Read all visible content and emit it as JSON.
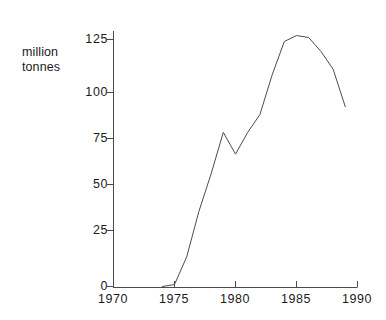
{
  "chart_data": {
    "type": "line",
    "title": "",
    "subtitle": "",
    "xlabel": "",
    "ylabel": "million\ntonnes",
    "ylabel_lines": [
      "million",
      "tonnes"
    ],
    "units": "million tonnes",
    "grid": false,
    "legend": null,
    "legend_position": "none",
    "xlim": [
      1970,
      1990
    ],
    "ylim": [
      0,
      137
    ],
    "xticks": [
      1970,
      1975,
      1980,
      1985,
      1990
    ],
    "xtick_labels": [
      "1970",
      "1975",
      "1980",
      "1985",
      "1990"
    ],
    "yticks": [
      0,
      25,
      50,
      75,
      100,
      125
    ],
    "ytick_labels": [
      "0",
      "25",
      "50",
      "75",
      "100",
      "125"
    ],
    "x": [
      1974,
      1975,
      1976,
      1977,
      1978,
      1979,
      1980,
      1981,
      1982,
      1983,
      1984,
      1985,
      1986,
      1987,
      1988,
      1989
    ],
    "values": [
      0,
      1,
      15,
      38,
      57,
      78,
      67,
      78,
      87,
      107,
      124,
      127,
      126,
      119,
      110,
      91
    ],
    "series": [
      {
        "name": "million tonnes",
        "color": "#4c4c4c",
        "x": [
          1974,
          1975,
          1976,
          1977,
          1978,
          1979,
          1980,
          1981,
          1982,
          1983,
          1984,
          1985,
          1986,
          1987,
          1988,
          1989
        ],
        "values": [
          0,
          1,
          15,
          38,
          57,
          78,
          67,
          78,
          87,
          107,
          124,
          127,
          126,
          119,
          110,
          91
        ]
      }
    ],
    "annotations": []
  },
  "colors": {
    "background": "#ffffff",
    "axis": "#4a4a4a",
    "line": "#4c4c4c",
    "text": "#1b1b1b"
  }
}
